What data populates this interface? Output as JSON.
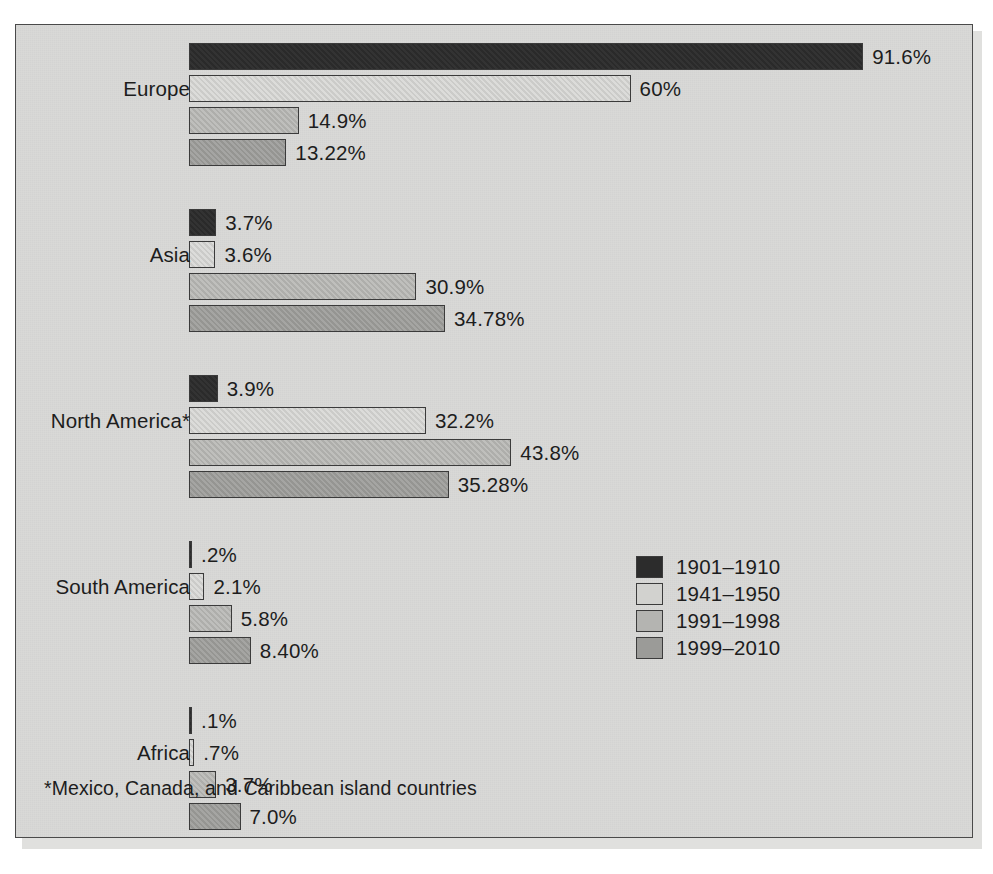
{
  "chart_data": {
    "type": "bar",
    "orientation": "horizontal",
    "title": "",
    "subtitle": "",
    "xlabel": "",
    "ylabel": "",
    "grid": false,
    "xlim": [
      0,
      100
    ],
    "value_suffix": "%",
    "legend_position": "bottom-right",
    "categories": [
      "Europe",
      "Asia",
      "North America*",
      "South America",
      "Africa"
    ],
    "series": [
      {
        "name": "1901–1910",
        "color": "#2c2c2c",
        "values": [
          91.6,
          3.7,
          3.9,
          0.2,
          0.1
        ],
        "labels": [
          "91.6%",
          "3.7%",
          "3.9%",
          ".2%",
          ".1%"
        ]
      },
      {
        "name": "1941–1950",
        "color": "#d2d2cf",
        "values": [
          60,
          3.6,
          32.2,
          2.1,
          0.7
        ],
        "labels": [
          "60%",
          "3.6%",
          "32.2%",
          "2.1%",
          ".7%"
        ]
      },
      {
        "name": "1991–1998",
        "color": "#b4b4b1",
        "values": [
          14.9,
          30.9,
          43.8,
          5.8,
          3.7
        ],
        "labels": [
          "14.9%",
          "30.9%",
          "43.8%",
          "5.8%",
          "3.7%"
        ]
      },
      {
        "name": "1999–2010",
        "color": "#9b9b98",
        "values": [
          13.22,
          34.78,
          35.28,
          8.4,
          7.0
        ],
        "labels": [
          "13.22%",
          "34.78%",
          "35.28%",
          "8.40%",
          "7.0%"
        ]
      }
    ],
    "annotations": [
      "*Mexico, Canada, and Caribbean island countries"
    ]
  },
  "legend": {
    "items": [
      {
        "label": "1901–1910",
        "color": "#2c2c2c"
      },
      {
        "label": "1941–1950",
        "color": "#d2d2cf"
      },
      {
        "label": "1991–1998",
        "color": "#b4b4b1"
      },
      {
        "label": "1999–2010",
        "color": "#9b9b98"
      }
    ]
  },
  "footnote": {
    "text": "*Mexico, Canada, and Caribbean island countries"
  },
  "layout": {
    "bar_origin_x": 173,
    "px_per_percent": 7.36,
    "bar_height": 27,
    "bar_gap": 5,
    "group_gap": 38,
    "first_group_top": 18,
    "value_label_offset": 9,
    "label_row_index": 1
  },
  "colors": {
    "panel_background": "#d9d9d7",
    "panel_border": "#4a4a4a",
    "bar_border": "#3b3b3b",
    "text": "#1d1d1d"
  }
}
